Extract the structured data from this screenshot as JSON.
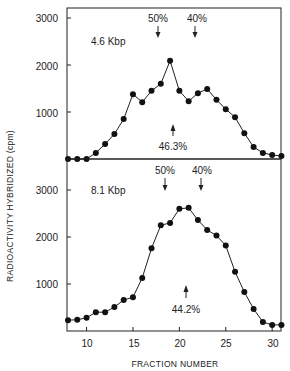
{
  "chart_data": [
    {
      "type": "line",
      "panel": "top",
      "label": "4.6 Kbp",
      "x": [
        8,
        9,
        10,
        11,
        12,
        13,
        14,
        15,
        16,
        17,
        18,
        19,
        20,
        21,
        22,
        23,
        24,
        25,
        26,
        27,
        28,
        29,
        30,
        31
      ],
      "values": [
        0,
        0,
        0,
        130,
        320,
        530,
        850,
        1380,
        1210,
        1450,
        1600,
        2090,
        1450,
        1230,
        1400,
        1490,
        1260,
        1060,
        890,
        550,
        255,
        130,
        85,
        65
      ],
      "xlabel": "FRACTION NUMBER",
      "ylabel": "RADIOACTIVITY HYBRIDIZED (cpm)",
      "yticks": [
        1000,
        2000,
        3000
      ],
      "ylim": [
        0,
        3200
      ],
      "xlim": [
        8,
        31
      ],
      "markers": [
        {
          "label": "50%",
          "x": 17.6,
          "direction": "down"
        },
        {
          "label": "40%",
          "x": 21.5,
          "direction": "down"
        },
        {
          "label": "46.3%",
          "x": 19.3,
          "direction": "up"
        }
      ],
      "grid": false
    },
    {
      "type": "line",
      "panel": "bottom",
      "label": "8.1 Kbp",
      "x": [
        8,
        9,
        10,
        11,
        12,
        13,
        14,
        15,
        16,
        17,
        18,
        19,
        20,
        21,
        22,
        23,
        24,
        25,
        26,
        27,
        28,
        29,
        30,
        31
      ],
      "values": [
        230,
        240,
        280,
        400,
        400,
        510,
        660,
        720,
        1130,
        1760,
        2250,
        2300,
        2600,
        2620,
        2360,
        2150,
        2030,
        1820,
        1260,
        830,
        470,
        190,
        130,
        130
      ],
      "xlabel": "FRACTION NUMBER",
      "ylabel": "RADIOACTIVITY HYBRIDIZED (cpm)",
      "xticks": [
        10,
        15,
        20,
        25,
        30
      ],
      "yticks": [
        1000,
        2000,
        3000
      ],
      "ylim": [
        0,
        3200
      ],
      "xlim": [
        8,
        31
      ],
      "markers": [
        {
          "label": "50%",
          "x": 18.4,
          "direction": "down"
        },
        {
          "label": "40%",
          "x": 22.3,
          "direction": "down"
        },
        {
          "label": "44.2%",
          "x": 20.7,
          "direction": "up"
        }
      ],
      "grid": false
    }
  ],
  "axes": {
    "ylabel": "RADIOACTIVITY HYBRIDIZED (cpm)",
    "xlabel": "FRACTION NUMBER",
    "ytick_labels": [
      "1000",
      "2000",
      "3000"
    ],
    "xtick_labels": [
      "10",
      "15",
      "20",
      "25",
      "30"
    ]
  },
  "panels": {
    "top": {
      "label": "4.6 Kbp",
      "marker_50": "50%",
      "marker_40": "40%",
      "peak_note": "46.3%"
    },
    "bottom": {
      "label": "8.1 Kbp",
      "marker_50": "50%",
      "marker_40": "40%",
      "peak_note": "44.2%"
    }
  }
}
